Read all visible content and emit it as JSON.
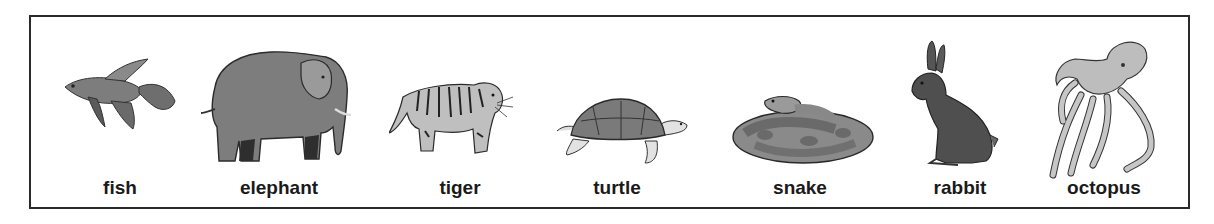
{
  "panel": {
    "animals": [
      {
        "name": "fish",
        "label": "fish",
        "icon": "fish-icon",
        "label_center_x": 118
      },
      {
        "name": "elephant",
        "label": "elephant",
        "icon": "elephant-icon",
        "label_center_x": 277
      },
      {
        "name": "tiger",
        "label": "tiger",
        "icon": "tiger-icon",
        "label_center_x": 458
      },
      {
        "name": "turtle",
        "label": "turtle",
        "icon": "turtle-icon",
        "label_center_x": 615
      },
      {
        "name": "snake",
        "label": "snake",
        "icon": "snake-icon",
        "label_center_x": 798
      },
      {
        "name": "rabbit",
        "label": "rabbit",
        "icon": "rabbit-icon",
        "label_center_x": 958
      },
      {
        "name": "octopus",
        "label": "octopus",
        "icon": "octopus-icon",
        "label_center_x": 1102
      }
    ],
    "colors": {
      "border": "#2a2a2a",
      "text": "#1a1a1a",
      "fill_dark": "#4a4a4a",
      "fill_mid": "#7d7d7d",
      "fill_light": "#b5b5b5"
    }
  }
}
